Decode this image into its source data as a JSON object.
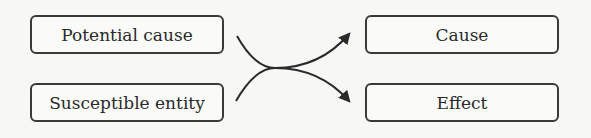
{
  "diagram": {
    "left_boxes": [
      {
        "label": "Potential cause"
      },
      {
        "label": "Susceptible entity"
      }
    ],
    "right_boxes": [
      {
        "label": "Cause"
      },
      {
        "label": "Effect"
      }
    ],
    "colors": {
      "stroke": "#2a2a2a",
      "background": "#f7f7f5"
    }
  }
}
